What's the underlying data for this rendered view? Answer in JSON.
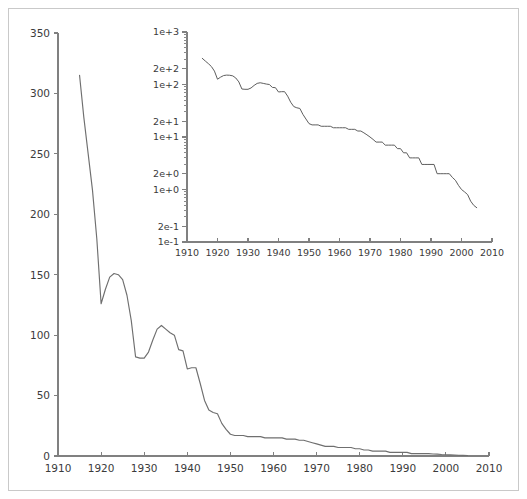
{
  "figure": {
    "background_color": "#ffffff",
    "frame_color": "#c9c9c9",
    "line_color": "#6f6f6f",
    "axis_color": "#808080"
  },
  "chart_data": [
    {
      "type": "line",
      "id": "main",
      "title": "",
      "xlabel": "",
      "ylabel": "",
      "xlim": [
        1910,
        2010
      ],
      "ylim": [
        0,
        350
      ],
      "xscale": "linear",
      "yscale": "linear",
      "grid": false,
      "legend": "none",
      "xticks": [
        1910,
        1920,
        1930,
        1940,
        1950,
        1960,
        1970,
        1980,
        1990,
        2000,
        2010
      ],
      "xticklabels": [
        "1910",
        "1920",
        "1930",
        "1940",
        "1950",
        "1960",
        "1970",
        "1980",
        "1990",
        "2000",
        "2010"
      ],
      "yticks": [
        0,
        50,
        100,
        150,
        200,
        250,
        300,
        350
      ],
      "yticklabels": [
        "0",
        "50",
        "100",
        "150",
        "200",
        "250",
        "300",
        "350"
      ],
      "x": [
        1915,
        1916,
        1917,
        1918,
        1919,
        1920,
        1921,
        1922,
        1923,
        1924,
        1925,
        1926,
        1927,
        1928,
        1929,
        1930,
        1931,
        1932,
        1933,
        1934,
        1935,
        1936,
        1937,
        1938,
        1939,
        1940,
        1941,
        1942,
        1943,
        1944,
        1945,
        1946,
        1947,
        1948,
        1949,
        1950,
        1951,
        1952,
        1953,
        1954,
        1955,
        1956,
        1957,
        1958,
        1959,
        1960,
        1961,
        1962,
        1963,
        1964,
        1965,
        1966,
        1967,
        1968,
        1969,
        1970,
        1971,
        1972,
        1973,
        1974,
        1975,
        1976,
        1977,
        1978,
        1979,
        1980,
        1981,
        1982,
        1983,
        1984,
        1985,
        1986,
        1987,
        1988,
        1989,
        1990,
        1991,
        1992,
        1993,
        1994,
        1995,
        1996,
        1997,
        1998,
        1999,
        2000,
        2001,
        2002,
        2003,
        2004,
        2005
      ],
      "values": [
        315,
        280,
        250,
        220,
        180,
        126,
        138,
        148,
        151,
        150,
        146,
        133,
        112,
        82,
        81,
        81,
        86,
        96,
        105,
        108,
        105,
        102,
        100,
        88,
        87,
        72,
        73,
        73,
        60,
        46,
        38,
        36,
        35,
        27,
        22,
        18,
        17,
        17,
        17,
        16,
        16,
        16,
        16,
        15,
        15,
        15,
        15,
        15,
        14,
        14,
        14,
        13,
        13,
        12,
        11,
        10,
        9,
        8,
        8,
        8,
        7,
        7,
        7,
        7,
        6,
        6,
        5,
        5,
        4,
        4,
        4,
        4,
        3,
        3,
        3,
        3,
        3,
        2,
        2,
        2,
        2,
        2,
        1.7,
        1.5,
        1.2,
        1,
        0.9,
        0.8,
        0.6,
        0.5,
        0.45
      ]
    },
    {
      "type": "line",
      "id": "inset",
      "title": "",
      "xlabel": "",
      "ylabel": "",
      "xlim": [
        1910,
        2010
      ],
      "ylim": [
        0.1,
        1000
      ],
      "xscale": "linear",
      "yscale": "log",
      "grid": false,
      "legend": "none",
      "xticks": [
        1910,
        1920,
        1930,
        1940,
        1950,
        1960,
        1970,
        1980,
        1990,
        2000,
        2010
      ],
      "xticklabels": [
        "1910",
        "1920",
        "1930",
        "1940",
        "1950",
        "1960",
        "1970",
        "1980",
        "1990",
        "2000",
        "2010"
      ],
      "yticks": [
        0.1,
        0.2,
        1,
        2,
        10,
        20,
        100,
        200,
        1000
      ],
      "yticklabels": [
        "1e-1",
        "2e-1",
        "1e+0",
        "2e+0",
        "1e+1",
        "2e+1",
        "1e+2",
        "2e+2",
        "1e+3"
      ],
      "x": [
        1915,
        1916,
        1917,
        1918,
        1919,
        1920,
        1921,
        1922,
        1923,
        1924,
        1925,
        1926,
        1927,
        1928,
        1929,
        1930,
        1931,
        1932,
        1933,
        1934,
        1935,
        1936,
        1937,
        1938,
        1939,
        1940,
        1941,
        1942,
        1943,
        1944,
        1945,
        1946,
        1947,
        1948,
        1949,
        1950,
        1951,
        1952,
        1953,
        1954,
        1955,
        1956,
        1957,
        1958,
        1959,
        1960,
        1961,
        1962,
        1963,
        1964,
        1965,
        1966,
        1967,
        1968,
        1969,
        1970,
        1971,
        1972,
        1973,
        1974,
        1975,
        1976,
        1977,
        1978,
        1979,
        1980,
        1981,
        1982,
        1983,
        1984,
        1985,
        1986,
        1987,
        1988,
        1989,
        1990,
        1991,
        1992,
        1993,
        1994,
        1995,
        1996,
        1997,
        1998,
        1999,
        2000,
        2001,
        2002,
        2003,
        2004,
        2005
      ],
      "values": [
        315,
        280,
        250,
        220,
        180,
        126,
        138,
        148,
        151,
        150,
        146,
        133,
        112,
        82,
        81,
        81,
        86,
        96,
        105,
        108,
        105,
        102,
        100,
        88,
        87,
        72,
        73,
        73,
        60,
        46,
        38,
        36,
        35,
        27,
        22,
        18,
        17,
        17,
        17,
        16,
        16,
        16,
        16,
        15,
        15,
        15,
        15,
        15,
        14,
        14,
        14,
        13,
        13,
        12,
        11,
        10,
        9,
        8,
        8,
        8,
        7,
        7,
        7,
        7,
        6,
        6,
        5,
        5,
        4,
        4,
        4,
        4,
        3,
        3,
        3,
        3,
        3,
        2,
        2,
        2,
        2,
        2,
        1.7,
        1.5,
        1.2,
        1,
        0.9,
        0.8,
        0.6,
        0.5,
        0.45
      ]
    }
  ]
}
